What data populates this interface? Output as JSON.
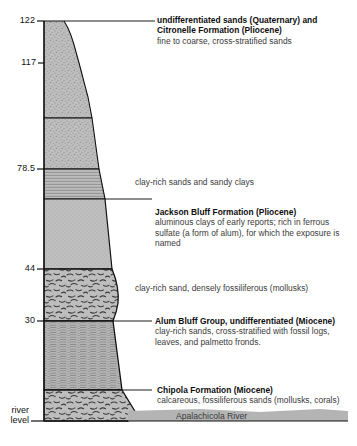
{
  "figure": {
    "kind": "stratigraphic-column",
    "axis": {
      "unit_note": "elevation in feet",
      "ticks": [
        {
          "label": "122",
          "value": 122
        },
        {
          "label": "117",
          "value": 117
        },
        {
          "label": "78.5",
          "value": 78.5
        },
        {
          "label": "44",
          "value": 44
        },
        {
          "label": "30",
          "value": 30
        }
      ],
      "base_label_line1": "river",
      "base_label_line2": "level"
    },
    "units": [
      {
        "id": "quaternary-citronelle",
        "title": "undifferentiated sands (Quaternary) and",
        "title2": "Citronelle Formation (Pliocene)",
        "description": "fine to coarse, cross-stratified sands",
        "pattern": "stippled-sand"
      },
      {
        "id": "clay-rich-sands-sandy-clays",
        "title": "",
        "description": "clay-rich sands and sandy clays",
        "pattern": "laminated-clay"
      },
      {
        "id": "jackson-bluff",
        "title": "Jackson Bluff Formation (Pliocene)",
        "description": "aluminous clays of early reports; rich in ferrous sulfate (a form of alum), for which the exposure is named",
        "pattern": "fine-stipple"
      },
      {
        "id": "clay-rich-sand-fossiliferous",
        "title": "",
        "description": "clay-rich sand, densely fossiliferous (mollusks)",
        "pattern": "shell-hash"
      },
      {
        "id": "alum-bluff-group",
        "title": "Alum Bluff Group, undifferentiated (Miocene)",
        "description": "clay-rich sands, cross-stratified with fossil logs, leaves, and palmetto fronds.",
        "pattern": "dense-laminated"
      },
      {
        "id": "chipola",
        "title": "Chipola Formation (Miocene)",
        "description": "calcareous, fossiliferous sands (mollusks, corals)",
        "pattern": "shell-hash"
      }
    ],
    "river": {
      "label": "Apalachicola River"
    },
    "colors": {
      "column_fill": "#b8b8b8",
      "column_fill_light": "#c4c4c4",
      "column_outline": "#111111",
      "river_band": "#b4b4b4",
      "text": "#2b2b2b",
      "title_text": "#0d0d0d",
      "background": "#ffffff"
    }
  }
}
